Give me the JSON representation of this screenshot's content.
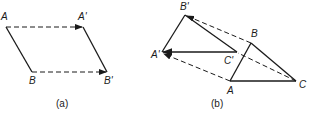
{
  "figure_a": {
    "caption": "(a)",
    "labels": {
      "A": "A",
      "A_prime": "A'",
      "B": "B",
      "B_prime": "B'"
    }
  },
  "figure_b": {
    "caption": "(b)",
    "labels": {
      "A": "A",
      "B": "B",
      "C": "C",
      "A_prime": "A'",
      "B_prime": "B'",
      "C_prime": "C'"
    }
  },
  "colors": {
    "ink": "#1a1a1a",
    "background": "#ffffff"
  }
}
